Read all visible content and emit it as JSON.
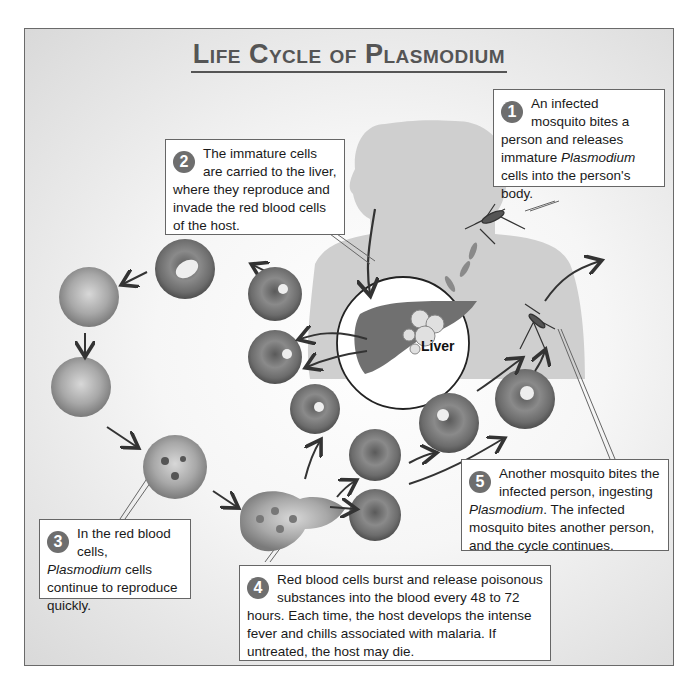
{
  "title": "Life Cycle of Plasmodium",
  "liver_label": "Liver",
  "steps": [
    {
      "number": "1",
      "text_before": "An infected mosquito bites a person and releases immature ",
      "italic": "Plasmodium",
      "text_after": " cells into the person's body."
    },
    {
      "number": "2",
      "text_before": "The immature cells are carried to the liver, where they reproduce and invade the red blood cells of the host.",
      "italic": "",
      "text_after": ""
    },
    {
      "number": "3",
      "text_before": "In the red blood cells, ",
      "italic": "Plasmodium",
      "text_after": " cells continue to reproduce quickly."
    },
    {
      "number": "4",
      "text_before": "Red blood cells burst and release poisonous substances into the blood every 48 to 72 hours. Each time, the host develops the intense fever and chills associated with malaria. If untreated, the host may die.",
      "italic": "",
      "text_after": ""
    },
    {
      "number": "5",
      "text_before": "Another mosquito bites the infected person, ingesting ",
      "italic": "Plasmodium",
      "text_after": ". The infected mosquito bites another person, and the cycle continues."
    }
  ],
  "colors": {
    "frame_border": "#6a6a6a",
    "badge": "#6e6e6e",
    "cell": "#7a7a7a",
    "silhouette": "#cfcfcf",
    "liver": "#707070"
  }
}
